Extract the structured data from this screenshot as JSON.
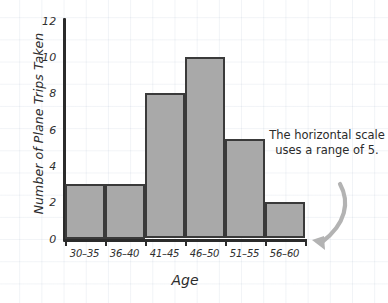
{
  "chart_data": {
    "type": "bar",
    "title": "",
    "xlabel": "Age",
    "ylabel": "Number of Plane Trips Taken",
    "categories": [
      "30–35",
      "36–40",
      "41–45",
      "46–50",
      "51–55",
      "56–60"
    ],
    "values": [
      3,
      3,
      8,
      10,
      5.5,
      2
    ],
    "ylim": [
      0,
      12
    ],
    "ytick_labels": [
      "0",
      "2",
      "4",
      "6",
      "8",
      "10",
      "12"
    ],
    "ytick_values": [
      0,
      2,
      4,
      6,
      8,
      10,
      12
    ],
    "grid": true,
    "legend": null,
    "annotations": [
      {
        "text": "The horizontal scale uses a range of 5.",
        "target": "56–60"
      }
    ],
    "colors": {
      "bar_fill": "#a9a9a9",
      "bar_edge": "#3a3a3a",
      "axis": "#2b2b2b",
      "text": "#2b2b2b",
      "arrow": "#b0b0b0",
      "grid": "#c9d4e2"
    }
  }
}
